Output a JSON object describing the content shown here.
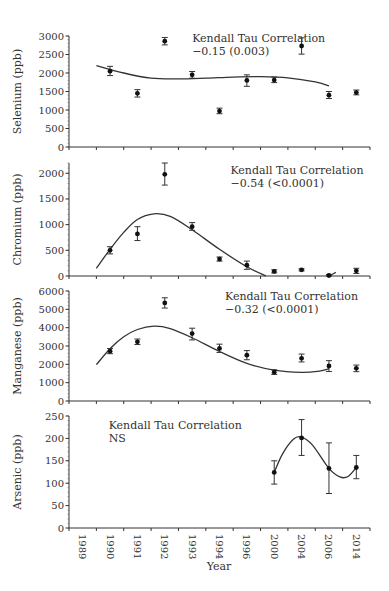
{
  "chart_data": [
    {
      "type": "scatter",
      "title": "",
      "ylabel": "Selenium (ppb)",
      "xlabel": "",
      "ylim": [
        0,
        3000
      ],
      "yticks": [
        0,
        500,
        1000,
        1500,
        2000,
        2500,
        3000
      ],
      "categories": [
        "1989",
        "1990",
        "1991",
        "1992",
        "1993",
        "1994",
        "1996",
        "2000",
        "2004",
        "2006",
        "2014"
      ],
      "points": [
        {
          "x": "1990",
          "y": 2050,
          "err_low": 1930,
          "err_high": 2180
        },
        {
          "x": "1991",
          "y": 1450,
          "err_low": 1350,
          "err_high": 1550
        },
        {
          "x": "1992",
          "y": 2860,
          "err_low": 2760,
          "err_high": 2960
        },
        {
          "x": "1993",
          "y": 1950,
          "err_low": 1860,
          "err_high": 2040
        },
        {
          "x": "1994",
          "y": 970,
          "err_low": 900,
          "err_high": 1050
        },
        {
          "x": "1996",
          "y": 1800,
          "err_low": 1640,
          "err_high": 1950
        },
        {
          "x": "2000",
          "y": 1810,
          "err_low": 1740,
          "err_high": 1890
        },
        {
          "x": "2004",
          "y": 2730,
          "err_low": 2510,
          "err_high": 2950
        },
        {
          "x": "2006",
          "y": 1400,
          "err_low": 1310,
          "err_high": 1500
        },
        {
          "x": "2014",
          "y": 1470,
          "err_low": 1410,
          "err_high": 1540
        }
      ],
      "trend_curve": [
        [
          0.5,
          2200
        ],
        [
          1.5,
          2000
        ],
        [
          2.5,
          1860
        ],
        [
          3.5,
          1840
        ],
        [
          4.5,
          1860
        ],
        [
          5.5,
          1890
        ],
        [
          6.5,
          1900
        ],
        [
          7.5,
          1870
        ],
        [
          8.5,
          1760
        ],
        [
          9.0,
          1650
        ]
      ],
      "annotation": {
        "line1": "Kendall Tau Correlation",
        "line2": "−0.15 (0.003)",
        "x": 4.5,
        "y": 2850
      }
    },
    {
      "type": "scatter",
      "title": "",
      "ylabel": "Chromium (ppb)",
      "xlabel": "",
      "ylim": [
        0,
        2200
      ],
      "yticks": [
        0,
        500,
        1000,
        1500,
        2000
      ],
      "categories": [
        "1989",
        "1990",
        "1991",
        "1992",
        "1993",
        "1994",
        "1996",
        "2000",
        "2004",
        "2006",
        "2014"
      ],
      "points": [
        {
          "x": "1990",
          "y": 500,
          "err_low": 430,
          "err_high": 570
        },
        {
          "x": "1991",
          "y": 820,
          "err_low": 690,
          "err_high": 960
        },
        {
          "x": "1992",
          "y": 1980,
          "err_low": 1770,
          "err_high": 2200
        },
        {
          "x": "1993",
          "y": 960,
          "err_low": 890,
          "err_high": 1040
        },
        {
          "x": "1994",
          "y": 330,
          "err_low": 290,
          "err_high": 370
        },
        {
          "x": "1996",
          "y": 210,
          "err_low": 130,
          "err_high": 290
        },
        {
          "x": "2000",
          "y": 90,
          "err_low": 60,
          "err_high": 120
        },
        {
          "x": "2004",
          "y": 120,
          "err_low": 100,
          "err_high": 140
        },
        {
          "x": "2006",
          "y": 10,
          "err_low": 0,
          "err_high": 30
        },
        {
          "x": "2014",
          "y": 100,
          "err_low": 50,
          "err_high": 150
        }
      ],
      "trend_curve": [
        [
          0.5,
          150
        ],
        [
          1.0,
          520
        ],
        [
          1.5,
          850
        ],
        [
          2.0,
          1100
        ],
        [
          2.6,
          1210
        ],
        [
          3.2,
          1160
        ],
        [
          4.0,
          900
        ],
        [
          5.0,
          520
        ],
        [
          6.0,
          180
        ],
        [
          6.7,
          0
        ]
      ],
      "trend_curve_tail": [
        [
          9.0,
          0
        ],
        [
          9.25,
          70
        ]
      ],
      "annotation": {
        "line1": "Kendall Tau Correlation",
        "line2": "−0.54 (<0.0001)",
        "x": 5.9,
        "y": 1980
      }
    },
    {
      "type": "scatter",
      "title": "",
      "ylabel": "Manganese (ppb)",
      "xlabel": "",
      "ylim": [
        0,
        6000
      ],
      "yticks": [
        0,
        1000,
        2000,
        3000,
        4000,
        5000,
        6000
      ],
      "categories": [
        "1989",
        "1990",
        "1991",
        "1992",
        "1993",
        "1994",
        "1996",
        "2000",
        "2004",
        "2006",
        "2014"
      ],
      "points": [
        {
          "x": "1990",
          "y": 2720,
          "err_low": 2580,
          "err_high": 2860
        },
        {
          "x": "1991",
          "y": 3230,
          "err_low": 3080,
          "err_high": 3380
        },
        {
          "x": "1992",
          "y": 5350,
          "err_low": 5070,
          "err_high": 5630
        },
        {
          "x": "1993",
          "y": 3680,
          "err_low": 3330,
          "err_high": 3970
        },
        {
          "x": "1994",
          "y": 2870,
          "err_low": 2650,
          "err_high": 3100
        },
        {
          "x": "1996",
          "y": 2500,
          "err_low": 2250,
          "err_high": 2750
        },
        {
          "x": "2000",
          "y": 1570,
          "err_low": 1450,
          "err_high": 1700
        },
        {
          "x": "2004",
          "y": 2330,
          "err_low": 2130,
          "err_high": 2560
        },
        {
          "x": "2006",
          "y": 1910,
          "err_low": 1610,
          "err_high": 2200
        },
        {
          "x": "2014",
          "y": 1780,
          "err_low": 1600,
          "err_high": 1960
        }
      ],
      "trend_curve": [
        [
          0.5,
          1980
        ],
        [
          1.0,
          2850
        ],
        [
          1.5,
          3500
        ],
        [
          2.0,
          3900
        ],
        [
          2.6,
          4080
        ],
        [
          3.2,
          3950
        ],
        [
          4.0,
          3450
        ],
        [
          5.0,
          2700
        ],
        [
          6.0,
          2050
        ],
        [
          7.0,
          1680
        ],
        [
          8.0,
          1560
        ],
        [
          8.6,
          1620
        ],
        [
          9.0,
          1760
        ]
      ],
      "annotation": {
        "line1": "Kendall Tau Correlation",
        "line2": "−0.32 (<0.0001)",
        "x": 5.7,
        "y": 5500
      }
    },
    {
      "type": "scatter",
      "title": "",
      "ylabel": "Arsenic (ppb)",
      "xlabel": "Year",
      "ylim": [
        0,
        250
      ],
      "yticks": [
        0,
        50,
        100,
        150,
        200,
        250
      ],
      "categories": [
        "1989",
        "1990",
        "1991",
        "1992",
        "1993",
        "1994",
        "1996",
        "2000",
        "2004",
        "2006",
        "2014"
      ],
      "points": [
        {
          "x": "2000",
          "y": 124,
          "err_low": 98,
          "err_high": 150
        },
        {
          "x": "2004",
          "y": 201,
          "err_low": 162,
          "err_high": 242
        },
        {
          "x": "2006",
          "y": 133,
          "err_low": 77,
          "err_high": 190
        },
        {
          "x": "2014",
          "y": 135,
          "err_low": 110,
          "err_high": 162
        }
      ],
      "trend_curve": [
        [
          7.0,
          124
        ],
        [
          7.3,
          165
        ],
        [
          7.7,
          198
        ],
        [
          8.0,
          203
        ],
        [
          8.4,
          185
        ],
        [
          9.0,
          133
        ],
        [
          9.4,
          114
        ],
        [
          9.7,
          115
        ],
        [
          10.0,
          135
        ]
      ],
      "annotation": {
        "line1": "Kendall Tau Correlation",
        "line2": "NS",
        "x": 1.45,
        "y": 222
      }
    }
  ],
  "x_axis": {
    "title": "Year",
    "labels": [
      "1989",
      "1990",
      "1991",
      "1992",
      "1993",
      "1994",
      "1996",
      "2000",
      "2004",
      "2006",
      "2014"
    ]
  }
}
